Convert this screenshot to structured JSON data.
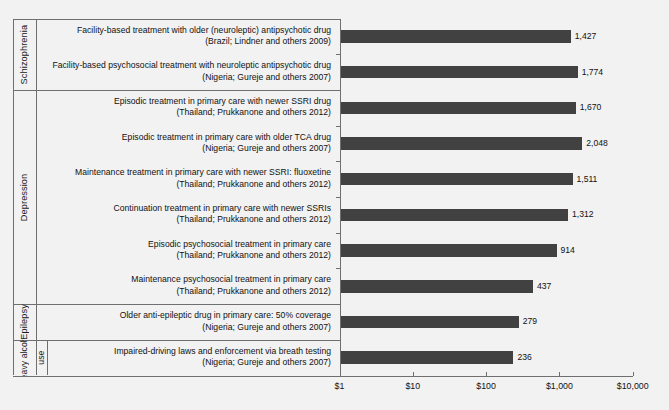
{
  "chart_data": {
    "type": "bar",
    "orientation": "horizontal",
    "title": "",
    "subtitle": "",
    "xlabel": "",
    "ylabel": "",
    "xscale": "log",
    "xlim": [
      1,
      10000
    ],
    "xticks": [
      1,
      10,
      100,
      1000,
      10000
    ],
    "xticklabels": [
      "$1",
      "$10",
      "$100",
      "$1,000",
      "$10,000"
    ],
    "grid": false,
    "legend": null,
    "bar_color": "#414141",
    "background_color": "#f2f2f2",
    "axis_color": "#6f6f6f",
    "groups": [
      {
        "label": "Schizophrenia",
        "items": [
          {
            "line1": "Facility-based treatment with older (neuroleptic) antipsychotic drug",
            "line2": "(Brazil; Lindner and others 2009)",
            "value": 1427,
            "value_label": "1,427"
          },
          {
            "line1": "Facility-based psychosocial treatment with neuroleptic antipsychotic drug",
            "line2": "(Nigeria; Gureje and others 2007)",
            "value": 1774,
            "value_label": "1,774"
          }
        ]
      },
      {
        "label": "Depression",
        "items": [
          {
            "line1": "Episodic treatment in primary care with newer SSRI drug",
            "line2": "(Thailand; Prukkanone and others 2012)",
            "value": 1670,
            "value_label": "1,670"
          },
          {
            "line1": "Episodic treatment in primary care with older TCA drug",
            "line2": "(Nigeria; Gureje and others 2007)",
            "value": 2048,
            "value_label": "2,048"
          },
          {
            "line1": "Maintenance treatment in primary care with newer SSRI: fluoxetine",
            "line2": "(Thailand; Prukkanone and others 2012)",
            "value": 1511,
            "value_label": "1,511"
          },
          {
            "line1": "Continuation treatment in primary care with newer SSRIs",
            "line2": "(Thailand; Prukkanone and others 2012)",
            "value": 1312,
            "value_label": "1,312"
          },
          {
            "line1": "Episodic psychosocial treatment in primary care",
            "line2": "(Thailand; Prukkanone and others 2012)",
            "value": 914,
            "value_label": "914"
          },
          {
            "line1": "Maintenance psychosocial treatment in primary care",
            "line2": "(Thailand; Prukkanone and others 2012)",
            "value": 437,
            "value_label": "437"
          }
        ]
      },
      {
        "label": "Epilepsy",
        "items": [
          {
            "line1": "Older anti-epileptic drug in primary care: 50% coverage",
            "line2": "(Nigeria; Gureje and others 2007)",
            "value": 279,
            "value_label": "279"
          }
        ]
      },
      {
        "label": "Heavy alcohol use",
        "label_col1": "Heavy alcohol",
        "label_col2": "use",
        "items": [
          {
            "line1": "Impaired-driving laws and enforcement via breath testing",
            "line2": "(Nigeria; Gureje and others 2007)",
            "value": 236,
            "value_label": "236"
          }
        ]
      }
    ]
  }
}
